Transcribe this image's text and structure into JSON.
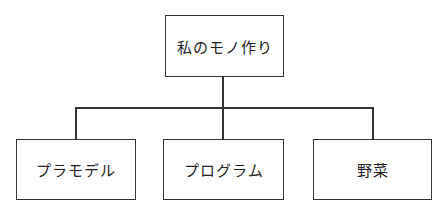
{
  "diagram": {
    "type": "tree",
    "root": {
      "label": "私のモノ作り"
    },
    "children": [
      {
        "label": "プラモデル"
      },
      {
        "label": "プログラム"
      },
      {
        "label": "野菜"
      }
    ]
  },
  "colors": {
    "stroke": "#333333",
    "background": "#ffffff",
    "text": "#222222"
  }
}
